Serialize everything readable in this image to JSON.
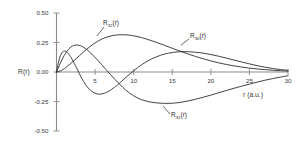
{
  "chart_data": {
    "type": "line",
    "title": "",
    "subtitle": "",
    "xlabel": "r (a.u.)",
    "ylabel": "R(r)",
    "xlim": [
      0,
      30
    ],
    "ylim": [
      -0.5,
      0.5
    ],
    "xticks": [
      5,
      10,
      15,
      20,
      25,
      30
    ],
    "xticklabels": [
      "5",
      "10",
      "15",
      "20",
      "25",
      "30"
    ],
    "yticks": [
      -0.5,
      -0.25,
      0.0,
      0.25,
      0.5
    ],
    "yticklabels": [
      "-0.50",
      "-0.25",
      "0.00",
      "0.25",
      "0.50"
    ],
    "grid": false,
    "legend_position": "inline-annotations",
    "annotations": [
      {
        "name": "R32",
        "text": "R",
        "sub": "32",
        "suffix": "(r)"
      },
      {
        "name": "R30",
        "text": "R",
        "sub": "30",
        "suffix": "(r)"
      },
      {
        "name": "R31",
        "text": "R",
        "sub": "31",
        "suffix": "(r)"
      }
    ],
    "series": [
      {
        "name": "R30(r)",
        "label_text": "R",
        "label_sub": "30",
        "label_suffix": "(r)",
        "x": [
          0.0,
          0.4,
          0.8,
          1.2,
          1.6,
          2.0,
          2.6,
          3.2,
          3.8,
          4.4,
          5.0,
          5.6,
          6.2,
          6.8,
          7.4,
          8.0,
          9.0,
          10.0,
          11.0,
          12.0,
          13.0,
          14.0,
          15.0,
          16.0,
          17.0,
          18.0,
          19.0,
          20.0,
          21.0,
          22.0,
          23.0,
          24.0,
          25.0,
          26.0,
          27.0,
          28.0,
          29.0,
          30.0
        ],
        "y": [
          0.0,
          0.12,
          0.17,
          0.175,
          0.15,
          0.11,
          0.035,
          -0.045,
          -0.11,
          -0.155,
          -0.18,
          -0.188,
          -0.18,
          -0.162,
          -0.135,
          -0.105,
          -0.045,
          0.01,
          0.06,
          0.1,
          0.13,
          0.152,
          0.165,
          0.172,
          0.172,
          0.168,
          0.16,
          0.148,
          0.134,
          0.118,
          0.101,
          0.085,
          0.069,
          0.054,
          0.041,
          0.03,
          0.021,
          0.014
        ]
      },
      {
        "name": "R31(r)",
        "label_text": "R",
        "label_sub": "31",
        "label_suffix": "(r)",
        "x": [
          0.0,
          0.5,
          1.0,
          1.6,
          2.2,
          2.8,
          3.4,
          4.0,
          4.6,
          5.2,
          5.8,
          6.4,
          7.0,
          7.6,
          8.2,
          9.0,
          10.0,
          11.0,
          12.0,
          13.0,
          14.0,
          15.0,
          16.0,
          17.0,
          18.0,
          19.0,
          20.0,
          21.0,
          22.0,
          23.0,
          24.0,
          25.0,
          26.0,
          27.0,
          28.0,
          29.0,
          30.0
        ],
        "y": [
          0.0,
          0.075,
          0.14,
          0.196,
          0.224,
          0.228,
          0.214,
          0.186,
          0.15,
          0.11,
          0.066,
          0.022,
          -0.022,
          -0.064,
          -0.104,
          -0.155,
          -0.202,
          -0.234,
          -0.252,
          -0.262,
          -0.266,
          -0.265,
          -0.258,
          -0.246,
          -0.231,
          -0.214,
          -0.196,
          -0.176,
          -0.157,
          -0.138,
          -0.12,
          -0.103,
          -0.086,
          -0.07,
          -0.056,
          -0.043,
          -0.032
        ]
      },
      {
        "name": "R32(r)",
        "label_text": "R",
        "label_sub": "32",
        "label_suffix": "(r)",
        "x": [
          0.0,
          0.6,
          1.2,
          1.8,
          2.4,
          3.0,
          3.6,
          4.2,
          4.8,
          5.4,
          6.0,
          6.6,
          7.2,
          7.8,
          8.4,
          9.0,
          9.6,
          10.2,
          11.0,
          12.0,
          13.0,
          14.0,
          15.0,
          16.0,
          17.0,
          18.0,
          19.0,
          20.0,
          21.0,
          22.0,
          23.0,
          24.0,
          25.0,
          26.0,
          27.0,
          28.0,
          29.0,
          30.0
        ],
        "y": [
          0.0,
          0.012,
          0.038,
          0.07,
          0.105,
          0.14,
          0.175,
          0.208,
          0.238,
          0.263,
          0.283,
          0.298,
          0.308,
          0.314,
          0.316,
          0.315,
          0.311,
          0.304,
          0.292,
          0.272,
          0.25,
          0.226,
          0.201,
          0.177,
          0.154,
          0.132,
          0.112,
          0.094,
          0.078,
          0.064,
          0.052,
          0.042,
          0.033,
          0.026,
          0.02,
          0.015,
          0.011,
          0.008
        ]
      }
    ]
  },
  "axes": {
    "y_axis_label": "R(r)",
    "x_axis_label": "r (a.u.)"
  },
  "colors": {
    "curve": "#2e2e2e",
    "axis": "#8a8a8a",
    "text": "#3a3a3a",
    "background": "#ffffff"
  }
}
